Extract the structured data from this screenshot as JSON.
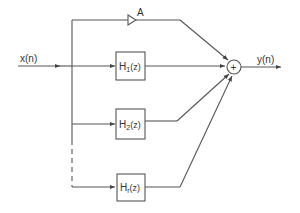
{
  "diagram": {
    "type": "block-diagram",
    "input_label": "x(n)",
    "output_label": "y(n)",
    "gain_label": "A",
    "summer_symbol": "+",
    "filters": [
      {
        "name": "H",
        "sub": "1",
        "arg": "(z)"
      },
      {
        "name": "H",
        "sub": "2",
        "arg": "(z)"
      },
      {
        "name": "H",
        "sub": "r",
        "arg": "(z)"
      }
    ]
  }
}
